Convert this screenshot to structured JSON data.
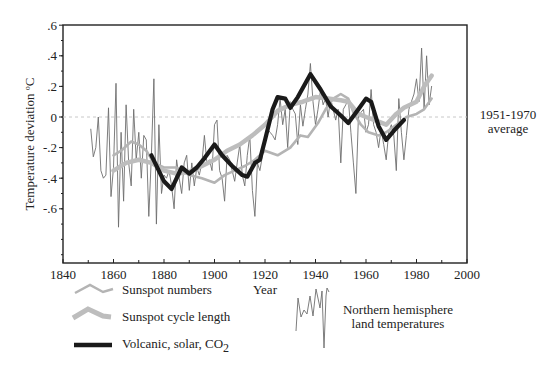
{
  "chart_data": {
    "type": "line",
    "title": "",
    "xlabel": "Year",
    "ylabel": "Temperature deviation ºC",
    "xlim": [
      1840,
      2000
    ],
    "ylim": [
      -0.95,
      0.6
    ],
    "x_ticks": [
      1840,
      1860,
      1880,
      1900,
      1920,
      1940,
      1960,
      1980,
      2000
    ],
    "x_tick_labels": [
      "1840",
      "1860",
      "1880",
      "1900",
      "1920",
      "1940",
      "1960",
      "1980",
      "2000"
    ],
    "y_ticks": [
      0.6,
      0.4,
      0.2,
      0,
      -0.2,
      -0.4,
      -0.6
    ],
    "y_tick_labels": [
      ".6",
      ".4",
      ".2",
      "0",
      "-.2",
      "-.4",
      "-.6"
    ],
    "grid": false,
    "reference_line": {
      "y": 0,
      "style": "dashed",
      "label_line1": "1951-1970",
      "label_line2": "average"
    },
    "legend_position": "below",
    "series": [
      {
        "name": "Sunspot numbers",
        "style": "medium-gray",
        "color": "#b4b4b4",
        "x": [
          1860,
          1863,
          1867,
          1870,
          1873,
          1876,
          1880,
          1885,
          1890,
          1895,
          1900,
          1904,
          1908,
          1912,
          1916,
          1920,
          1925,
          1930,
          1934,
          1937,
          1941,
          1944,
          1947,
          1950,
          1953,
          1955,
          1958,
          1961,
          1965,
          1968,
          1972,
          1976,
          1980,
          1983,
          1986
        ],
        "values": [
          -0.25,
          -0.22,
          -0.16,
          -0.18,
          -0.22,
          -0.3,
          -0.33,
          -0.33,
          -0.38,
          -0.4,
          -0.43,
          -0.38,
          -0.35,
          -0.32,
          -0.28,
          -0.22,
          -0.25,
          -0.2,
          -0.12,
          -0.13,
          -0.04,
          0.05,
          0.12,
          0.15,
          0.12,
          0.03,
          -0.05,
          -0.1,
          -0.12,
          -0.1,
          -0.05,
          0.0,
          0.02,
          0.05,
          0.12
        ]
      },
      {
        "name": "Sunspot cycle length",
        "style": "thick-light-gray",
        "color": "#bdbdbd",
        "x": [
          1860,
          1865,
          1870,
          1875,
          1880,
          1885,
          1890,
          1895,
          1900,
          1905,
          1910,
          1915,
          1920,
          1925,
          1930,
          1935,
          1940,
          1945,
          1950,
          1953,
          1957,
          1960,
          1965,
          1968,
          1972,
          1975,
          1980,
          1983,
          1986
        ],
        "values": [
          -0.35,
          -0.3,
          -0.28,
          -0.3,
          -0.35,
          -0.37,
          -0.36,
          -0.32,
          -0.28,
          -0.22,
          -0.18,
          -0.12,
          -0.05,
          0.04,
          0.08,
          0.1,
          0.13,
          0.12,
          0.11,
          0.1,
          0.02,
          0.0,
          -0.03,
          -0.05,
          0.02,
          0.06,
          0.1,
          0.2,
          0.27
        ]
      },
      {
        "name": "Volcanic, solar, CO2",
        "style": "thick-black",
        "color": "#1a1a1a",
        "x": [
          1875,
          1880,
          1883,
          1887,
          1890,
          1893,
          1896,
          1900,
          1903,
          1907,
          1911,
          1913,
          1916,
          1918,
          1920,
          1923,
          1925,
          1928,
          1930,
          1933,
          1936,
          1938,
          1942,
          1946,
          1950,
          1953,
          1957,
          1960,
          1962,
          1965,
          1968,
          1971,
          1975
        ],
        "values": [
          -0.25,
          -0.42,
          -0.47,
          -0.33,
          -0.37,
          -0.33,
          -0.27,
          -0.18,
          -0.25,
          -0.32,
          -0.38,
          -0.39,
          -0.3,
          -0.28,
          -0.15,
          0.05,
          0.13,
          0.12,
          0.06,
          0.13,
          0.22,
          0.28,
          0.18,
          0.07,
          0.01,
          -0.04,
          0.05,
          0.12,
          0.1,
          -0.06,
          -0.15,
          -0.09,
          -0.02
        ]
      },
      {
        "name": "Northern hemisphere land temperatures",
        "style": "thin-dark-gray",
        "color": "#6e6e6e",
        "x": [
          1851,
          1852,
          1853,
          1854,
          1855,
          1856,
          1857,
          1858,
          1859,
          1860,
          1861,
          1862,
          1863,
          1864,
          1865,
          1866,
          1867,
          1868,
          1869,
          1870,
          1871,
          1872,
          1873,
          1874,
          1875,
          1876,
          1877,
          1878,
          1879,
          1880,
          1881,
          1882,
          1883,
          1884,
          1885,
          1886,
          1887,
          1888,
          1889,
          1890,
          1891,
          1892,
          1893,
          1894,
          1895,
          1896,
          1897,
          1898,
          1899,
          1900,
          1901,
          1902,
          1903,
          1904,
          1905,
          1906,
          1907,
          1908,
          1909,
          1910,
          1911,
          1912,
          1913,
          1914,
          1915,
          1916,
          1917,
          1918,
          1919,
          1920,
          1921,
          1922,
          1923,
          1924,
          1925,
          1926,
          1927,
          1928,
          1929,
          1930,
          1931,
          1932,
          1933,
          1934,
          1935,
          1936,
          1937,
          1938,
          1939,
          1940,
          1941,
          1942,
          1943,
          1944,
          1945,
          1946,
          1947,
          1948,
          1949,
          1950,
          1951,
          1952,
          1953,
          1954,
          1955,
          1956,
          1957,
          1958,
          1959,
          1960,
          1961,
          1962,
          1963,
          1964,
          1965,
          1966,
          1967,
          1968,
          1969,
          1970,
          1971,
          1972,
          1973,
          1974,
          1975,
          1976,
          1977,
          1978,
          1979,
          1980,
          1981,
          1982,
          1983,
          1984,
          1985,
          1986
        ],
        "values": [
          -0.08,
          -0.26,
          -0.2,
          0.0,
          -0.35,
          -0.4,
          -0.38,
          0.06,
          -0.52,
          -0.33,
          0.22,
          -0.72,
          -0.1,
          -0.55,
          0.08,
          -0.3,
          -0.45,
          0.05,
          -0.28,
          -0.1,
          -0.4,
          -0.12,
          -0.15,
          -0.65,
          -0.25,
          0.25,
          -0.7,
          -0.05,
          -0.5,
          -0.38,
          -0.4,
          -0.35,
          -0.45,
          -0.6,
          -0.28,
          -0.4,
          -0.5,
          -0.3,
          -0.25,
          -0.48,
          -0.3,
          -0.45,
          -0.33,
          -0.38,
          -0.3,
          -0.12,
          -0.3,
          -0.28,
          -0.35,
          -0.05,
          -0.02,
          -0.35,
          -0.4,
          -0.55,
          -0.25,
          -0.28,
          -0.35,
          -0.42,
          -0.3,
          -0.18,
          -0.38,
          -0.45,
          -0.25,
          -0.12,
          -0.48,
          -0.65,
          -0.3,
          -0.35,
          -0.25,
          -0.15,
          -0.08,
          -0.1,
          -0.12,
          -0.15,
          -0.05,
          0.12,
          -0.05,
          0.05,
          -0.2,
          0.1,
          0.05,
          0.02,
          -0.18,
          0.08,
          -0.06,
          0.05,
          0.15,
          0.35,
          0.1,
          -0.05,
          0.05,
          0.18,
          0.08,
          0.12,
          0.0,
          0.12,
          0.05,
          -0.02,
          0.05,
          -0.3,
          0.05,
          0.08,
          0.12,
          -0.1,
          -0.3,
          -0.5,
          0.0,
          0.03,
          0.05,
          -0.1,
          -0.05,
          0.18,
          -0.05,
          -0.1,
          -0.2,
          -0.08,
          -0.18,
          -0.28,
          -0.1,
          -0.05,
          -0.12,
          -0.35,
          0.12,
          -0.1,
          -0.28,
          -0.12,
          0.05,
          0.1,
          0.15,
          0.25,
          0.1,
          0.45,
          0.05,
          0.4,
          0.08,
          0.2
        ]
      }
    ],
    "legend": [
      {
        "label": "Sunspot numbers",
        "glyph": "zigzag-medium-gray"
      },
      {
        "label": "Sunspot cycle length",
        "glyph": "zigzag-thick-gray"
      },
      {
        "label": "Volcanic, solar, CO",
        "subscript": "2",
        "glyph": "thick-black-line"
      },
      {
        "label_line1": "Northern hemisphere",
        "label_line2": "land temperatures",
        "glyph": "thin-noisy-line"
      }
    ]
  }
}
